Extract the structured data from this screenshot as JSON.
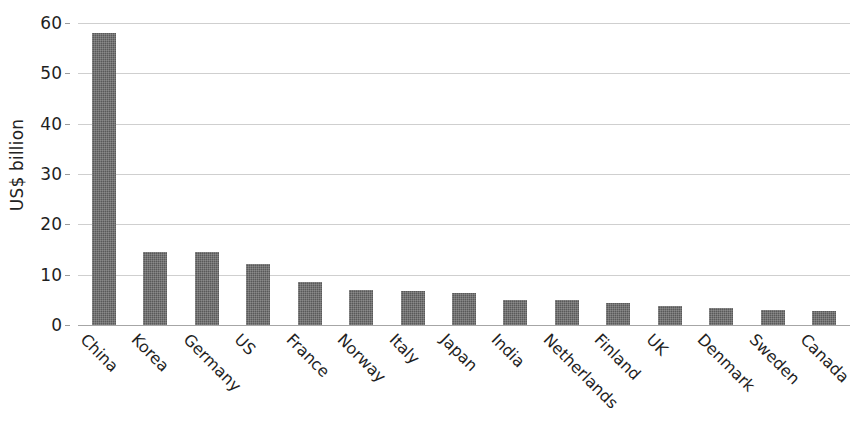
{
  "chart_data": {
    "type": "bar",
    "title": "",
    "subtitle": "",
    "xlabel": "",
    "ylabel": "US$ billion",
    "ylim": [
      0,
      60
    ],
    "ytick_step": 10,
    "yticks": [
      "0",
      "10",
      "20",
      "30",
      "40",
      "50",
      "60"
    ],
    "grid": "horizontal",
    "legend": "none",
    "bar_color": "#595959",
    "gridline_color": "#cfcfcf",
    "axis_color": "#a6a6a6",
    "categories": [
      "China",
      "Korea",
      "Germany",
      "US",
      "France",
      "Norway",
      "Italy",
      "Japan",
      "India",
      "Netherlands",
      "Finland",
      "UK",
      "Denmark",
      "Sweden",
      "Canada"
    ],
    "values": [
      58.0,
      14.5,
      14.5,
      12.2,
      8.5,
      6.9,
      6.7,
      6.3,
      5.0,
      5.0,
      4.3,
      3.7,
      3.4,
      3.0,
      2.7
    ]
  }
}
